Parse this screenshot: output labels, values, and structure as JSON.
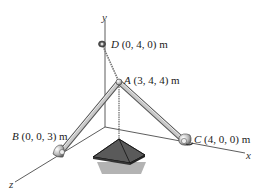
{
  "diagram": {
    "type": "3D statics diagram",
    "axes": {
      "x": "x",
      "y": "y",
      "z": "z"
    },
    "points": {
      "D": {
        "letter": "D",
        "coords": "(0, 4, 0) m"
      },
      "A": {
        "letter": "A",
        "coords": "(3, 4, 4) m"
      },
      "B": {
        "letter": "B",
        "coords": "(0, 0, 3) m"
      },
      "C": {
        "letter": "C",
        "coords": "(4, 0, 0) m"
      }
    },
    "members": [
      {
        "from": "A",
        "to": "B",
        "kind": "strut"
      },
      {
        "from": "A",
        "to": "C",
        "kind": "strut"
      },
      {
        "from": "A",
        "to": "D",
        "kind": "cable"
      }
    ],
    "load": "suspended pyramid-shaped weight hanging from A"
  }
}
